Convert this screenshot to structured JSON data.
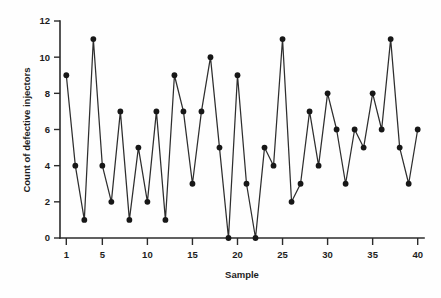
{
  "chart_data": {
    "type": "line",
    "title": "",
    "subtitle": "",
    "xlabel": "Sample",
    "ylabel": "Count of defective injectors",
    "xlim": [
      0.3,
      40.7
    ],
    "ylim": [
      0,
      12
    ],
    "grid": false,
    "legend": null,
    "legend_position": "none",
    "marker": "filled-circle",
    "line_color": "#2e2e2e",
    "marker_color": "#171717",
    "x": [
      1,
      2,
      3,
      4,
      5,
      6,
      7,
      8,
      9,
      10,
      11,
      12,
      13,
      14,
      15,
      16,
      17,
      18,
      19,
      20,
      21,
      22,
      23,
      24,
      25,
      26,
      27,
      28,
      29,
      30,
      31,
      32,
      33,
      34,
      35,
      36,
      37,
      38,
      39,
      40
    ],
    "values": [
      9,
      4,
      1,
      11,
      4,
      2,
      7,
      1,
      5,
      2,
      7,
      1,
      9,
      7,
      3,
      7,
      10,
      5,
      0,
      9,
      3,
      0,
      5,
      4,
      11,
      2,
      3,
      7,
      4,
      8,
      6,
      3,
      6,
      5,
      8,
      6,
      11,
      5,
      3,
      6
    ],
    "series": [
      {
        "name": "Count of defective injectors",
        "values": [
          9,
          4,
          1,
          11,
          4,
          2,
          7,
          1,
          5,
          2,
          7,
          1,
          9,
          7,
          3,
          7,
          10,
          5,
          0,
          9,
          3,
          0,
          5,
          4,
          11,
          2,
          3,
          7,
          4,
          8,
          6,
          3,
          6,
          5,
          8,
          6,
          11,
          5,
          3,
          6
        ]
      }
    ],
    "xticks": [
      1,
      5,
      10,
      15,
      20,
      25,
      30,
      35,
      40
    ],
    "xticklabels": [
      "1",
      "5",
      "10",
      "15",
      "20",
      "25",
      "30",
      "35",
      "40"
    ],
    "yticks": [
      0,
      2,
      4,
      6,
      8,
      10,
      12
    ],
    "yticklabels": [
      "0",
      "2",
      "4",
      "6",
      "8",
      "10",
      "12"
    ],
    "annotations": []
  },
  "figure": {
    "background": "#fefefe",
    "axis_color": "#2b2b2b",
    "text_color": "#1d1d1d"
  }
}
